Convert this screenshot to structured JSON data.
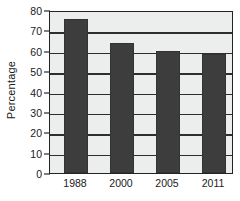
{
  "chart_data": {
    "type": "bar",
    "title": "",
    "xlabel": "",
    "ylabel": "Percentage",
    "categories": [
      "1988",
      "2000",
      "2005",
      "2011"
    ],
    "values": [
      75.5,
      64,
      60,
      58.5
    ],
    "ylim": [
      0,
      80
    ],
    "ytick_values": [
      0,
      10,
      20,
      30,
      40,
      50,
      60,
      70,
      80
    ],
    "ytick_labels": [
      "0",
      "10",
      "20",
      "30",
      "40",
      "50",
      "60",
      "70",
      "80"
    ],
    "grid": true,
    "legend": "none",
    "bar_color": "#3d3d3d",
    "plot_background": "#eceded",
    "axis_color": "#232323"
  }
}
